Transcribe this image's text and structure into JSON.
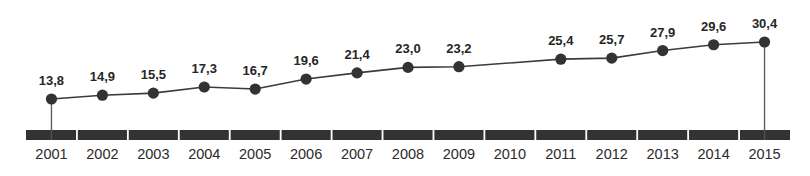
{
  "chart_data": {
    "type": "line",
    "title": "",
    "subtitle": "",
    "xlabel": "",
    "ylabel": "",
    "grid": false,
    "legend": false,
    "legend_position": "none",
    "decimal_separator": ",",
    "categories": [
      "2001",
      "2002",
      "2003",
      "2004",
      "2005",
      "2006",
      "2007",
      "2008",
      "2009",
      "2010",
      "2011",
      "2012",
      "2013",
      "2014",
      "2015"
    ],
    "values": [
      13.8,
      14.9,
      15.5,
      17.3,
      16.7,
      19.6,
      21.4,
      23.0,
      23.2,
      null,
      25.4,
      25.7,
      27.9,
      29.6,
      30.4
    ],
    "point_labels": [
      "13,8",
      "14,9",
      "15,5",
      "17,3",
      "16,7",
      "19,6",
      "21,4",
      "23,0",
      "23,2",
      "",
      "25,4",
      "25,7",
      "27,9",
      "29,6",
      "30,4"
    ],
    "ylim": [
      12.0,
      31.5
    ],
    "xlim": [
      2001,
      2015
    ],
    "series": [
      {
        "name": "series-1",
        "values": [
          13.8,
          14.9,
          15.5,
          17.3,
          16.7,
          19.6,
          21.4,
          23.0,
          23.2,
          null,
          25.4,
          25.7,
          27.9,
          29.6,
          30.4
        ]
      }
    ]
  },
  "style": {
    "line_color": "#3b3b3b",
    "marker_color": "#333333",
    "axis_bar_color": "#333333",
    "axis_separator_color": "#ffffff",
    "drop_line_color": "#555555",
    "label_color": "#262626",
    "tick_color": "#2b2b2b",
    "background": "#ffffff"
  },
  "axis": {
    "drop_line_categories": [
      "2001",
      "2015"
    ]
  }
}
